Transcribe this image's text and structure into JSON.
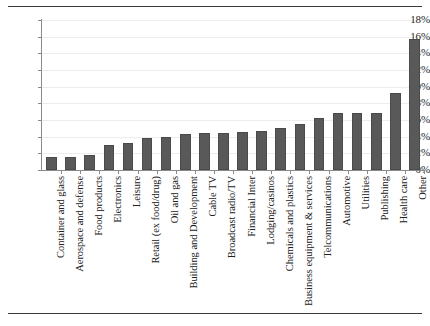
{
  "chart_data": {
    "type": "bar",
    "title": "",
    "subtitle": "",
    "xlabel": "",
    "ylabel": "",
    "ylim": [
      0,
      18
    ],
    "ytick_labels": [
      "0%",
      "2%",
      "4%",
      "6%",
      "8%",
      "10%",
      "12%",
      "14%",
      "16%",
      "18%"
    ],
    "ytick_values": [
      0,
      2,
      4,
      6,
      8,
      10,
      12,
      14,
      16,
      18
    ],
    "grid": true,
    "grid_axis": "y",
    "legend": false,
    "legend_position": "none",
    "bar_color": "#595959",
    "axis_color": "#8a8a8a",
    "categories": [
      "Container and glass",
      "Aerospace and defense",
      "Food products",
      "Electronics",
      "Leisure",
      "Retail (ex food/drug)",
      "Oil and gas",
      "Building and Development",
      "Cable TV",
      "Broadcast radio/TV",
      "Financial Inter",
      "Lodging/casinos",
      "Chemicals and plastics",
      "Business equipment & services",
      "Telcommunications",
      "Automotive",
      "Utilities",
      "Publishing",
      "Health care",
      "Other"
    ],
    "values": [
      1.6,
      1.6,
      1.8,
      3.0,
      3.3,
      3.8,
      4.0,
      4.3,
      4.4,
      4.5,
      4.6,
      4.7,
      5.0,
      5.5,
      6.2,
      6.8,
      6.8,
      6.8,
      9.2,
      15.7
    ]
  }
}
